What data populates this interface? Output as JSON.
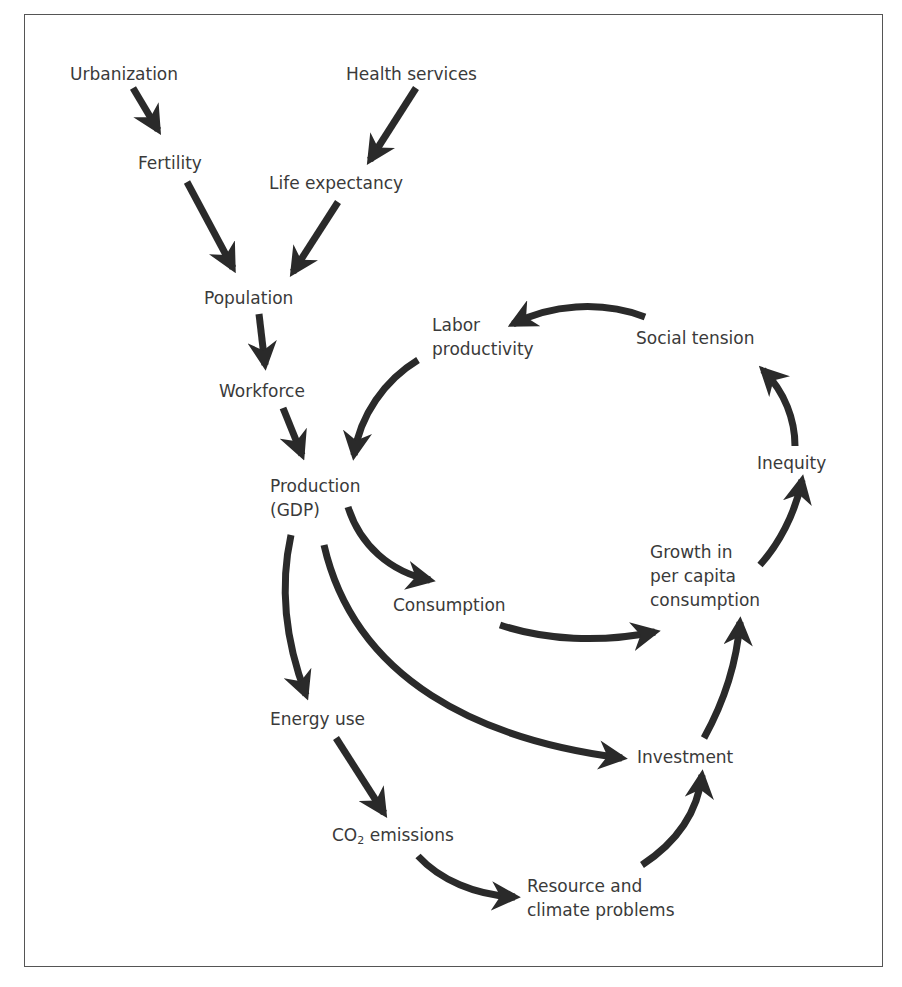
{
  "diagram": {
    "type": "causal-loop",
    "nodes": {
      "urbanization": {
        "label": "Urbanization"
      },
      "health_services": {
        "label": "Health services"
      },
      "fertility": {
        "label": "Fertility"
      },
      "life_expectancy": {
        "label": "Life expectancy"
      },
      "population": {
        "label": "Population"
      },
      "workforce": {
        "label": "Workforce"
      },
      "labor_productivity": {
        "line1": "Labor",
        "line2": "productivity"
      },
      "social_tension": {
        "label": "Social tension"
      },
      "production": {
        "line1": "Production",
        "line2": "(GDP)"
      },
      "inequity": {
        "label": "Inequity"
      },
      "growth": {
        "line1": "Growth in",
        "line2": "per capita",
        "line3": "consumption"
      },
      "consumption": {
        "label": "Consumption"
      },
      "energy_use": {
        "label": "Energy use"
      },
      "investment": {
        "label": "Investment"
      },
      "co2_emissions": {
        "prefix": "CO",
        "sub": "2",
        "suffix": " emissions"
      },
      "resource_climate": {
        "line1": "Resource and",
        "line2": "climate problems"
      }
    },
    "edges": [
      {
        "from": "Urbanization",
        "to": "Fertility"
      },
      {
        "from": "Health services",
        "to": "Life expectancy"
      },
      {
        "from": "Fertility",
        "to": "Population"
      },
      {
        "from": "Life expectancy",
        "to": "Population"
      },
      {
        "from": "Population",
        "to": "Workforce"
      },
      {
        "from": "Workforce",
        "to": "Production (GDP)"
      },
      {
        "from": "Labor productivity",
        "to": "Production (GDP)"
      },
      {
        "from": "Social tension",
        "to": "Labor productivity"
      },
      {
        "from": "Inequity",
        "to": "Social tension"
      },
      {
        "from": "Growth in per capita consumption",
        "to": "Inequity"
      },
      {
        "from": "Production (GDP)",
        "to": "Consumption"
      },
      {
        "from": "Consumption",
        "to": "Growth in per capita consumption"
      },
      {
        "from": "Production (GDP)",
        "to": "Energy use"
      },
      {
        "from": "Production (GDP)",
        "to": "Investment"
      },
      {
        "from": "Investment",
        "to": "Growth in per capita consumption"
      },
      {
        "from": "Energy use",
        "to": "CO2 emissions"
      },
      {
        "from": "CO2 emissions",
        "to": "Resource and climate problems"
      },
      {
        "from": "Resource and climate problems",
        "to": "Investment"
      }
    ],
    "colors": {
      "arrow": "#2a2a2a",
      "text": "#3a3a3a",
      "frame": "#555555"
    }
  }
}
